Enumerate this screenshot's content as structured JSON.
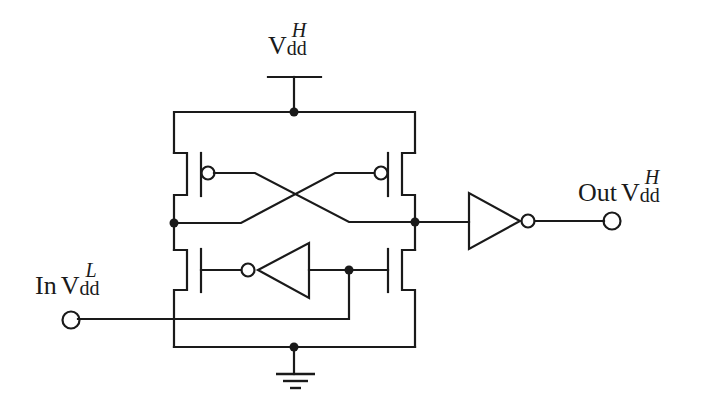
{
  "diagram": {
    "colors": {
      "wire": "#1a1a1a",
      "inverter_fill": "#c8c8c8",
      "background": "#ffffff"
    },
    "labels": {
      "vdd_high": {
        "main": "V",
        "sub": "dd",
        "sup": "H"
      },
      "input": {
        "prefix": "In",
        "main": "V",
        "sub": "dd",
        "sup": "L"
      },
      "output": {
        "prefix": "Out",
        "main": "V",
        "sub": "dd",
        "sup": "H"
      }
    },
    "components": [
      {
        "id": "pmos-left",
        "type": "PMOS"
      },
      {
        "id": "pmos-right",
        "type": "PMOS"
      },
      {
        "id": "nmos-left",
        "type": "NMOS"
      },
      {
        "id": "nmos-right",
        "type": "NMOS"
      },
      {
        "id": "input-inverter",
        "type": "inverter",
        "supply": "Vdd_L"
      },
      {
        "id": "output-inverter",
        "type": "inverter",
        "supply": "Vdd_H"
      },
      {
        "id": "vdd-supply",
        "type": "supply",
        "label": "Vdd_H"
      },
      {
        "id": "ground",
        "type": "ground"
      }
    ]
  }
}
